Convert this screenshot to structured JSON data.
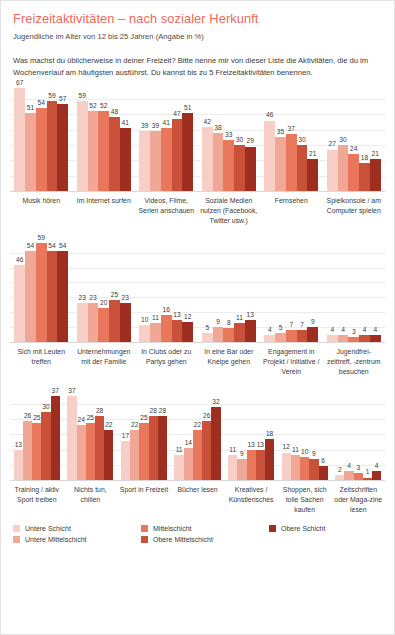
{
  "header": {
    "title": "Freizeitaktivitäten – nach sozialer Herkunft",
    "subtitle": "Jugendliche im Alter von 12 bis 25 Jahren (Angabe in %)",
    "question": "Was machst du üblicherweise in deiner Freizeit? Bitte nenne mir von dieser Liste die Aktivitäten, die du im Wochenverlauf am häufigsten ausführst. Du kannst bis zu 5 Freizeitaktivitäten benennen."
  },
  "legend": {
    "items": [
      {
        "label": "Untere Schicht",
        "color": "#f8cfc6"
      },
      {
        "label": "Untere Mittelschicht",
        "color": "#f1a795"
      },
      {
        "label": "Mittelschicht",
        "color": "#e8775c"
      },
      {
        "label": "Obere Mittelschicht",
        "color": "#c9513a"
      },
      {
        "label": "Obere Schicht",
        "color": "#9e2f20"
      }
    ],
    "columns": [
      [
        0,
        1
      ],
      [
        2,
        3
      ],
      [
        4
      ]
    ]
  },
  "chart_data": {
    "type": "bar",
    "title": "Freizeitaktivitäten – nach sozialer Herkunft",
    "subtitle": "Jugendliche im Alter von 12 bis 25 Jahren (Angabe in %)",
    "xlabel": "",
    "ylabel": "Prozent",
    "ylim": [
      0,
      70
    ],
    "grid": true,
    "legend_position": "bottom",
    "series": [
      {
        "name": "Untere Schicht",
        "color": "#f8cfc6"
      },
      {
        "name": "Untere Mittelschicht",
        "color": "#f1a795"
      },
      {
        "name": "Mittelschicht",
        "color": "#e8775c"
      },
      {
        "name": "Obere Mittelschicht",
        "color": "#c9513a"
      },
      {
        "name": "Obere Schicht",
        "color": "#9e2f20"
      }
    ],
    "rows": [
      {
        "row_max": 70,
        "gridlines": 6,
        "categories": [
          {
            "label": "Musik hören",
            "values": [
              67,
              51,
              54,
              59,
              57
            ]
          },
          {
            "label": "Im Internet surfen",
            "values": [
              59,
              52,
              52,
              48,
              41
            ]
          },
          {
            "label": "Videos, Filme, Serien anschauen",
            "values": [
              39,
              39,
              41,
              47,
              51
            ]
          },
          {
            "label": "Soziale Medien nutzen (Facebook, Twitter usw.)",
            "values": [
              42,
              38,
              33,
              30,
              29
            ]
          },
          {
            "label": "Fernsehen",
            "values": [
              46,
              35,
              37,
              30,
              21
            ]
          },
          {
            "label": "Spielkonsole / am Computer spielen",
            "values": [
              27,
              30,
              24,
              18,
              21
            ]
          }
        ]
      },
      {
        "row_max": 62,
        "gridlines": 6,
        "categories": [
          {
            "label": "Sich mit Leuten treffen",
            "values": [
              46,
              54,
              59,
              54,
              54
            ]
          },
          {
            "label": "Unternehmungen mit der Familie",
            "values": [
              23,
              23,
              20,
              25,
              23
            ]
          },
          {
            "label": "In Clubs oder zu Partys gehen",
            "values": [
              10,
              11,
              16,
              13,
              12
            ]
          },
          {
            "label": "In eine Bar oder Kneipe gehen",
            "values": [
              5,
              9,
              8,
              11,
              13
            ]
          },
          {
            "label": "Engagement in Projekt / Initiative / Verein",
            "values": [
              4,
              5,
              7,
              7,
              9
            ]
          },
          {
            "label": "Jugendfrei-zeittreff, -zentrum besuchen",
            "values": [
              4,
              4,
              3,
              4,
              4
            ]
          }
        ]
      },
      {
        "row_max": 40,
        "gridlines": 5,
        "categories": [
          {
            "label": "Training / aktiv Sport treiben",
            "values": [
              13,
              26,
              25,
              30,
              37
            ]
          },
          {
            "label": "Nichts tun, chillen",
            "values": [
              37,
              24,
              25,
              28,
              22
            ]
          },
          {
            "label": "Sport in Freizeit",
            "values": [
              17,
              22,
              25,
              28,
              28
            ]
          },
          {
            "label": "Bücher lesen",
            "values": [
              11,
              14,
              22,
              26,
              32
            ]
          },
          {
            "label": "Kreatives / Künstlerisches",
            "values": [
              11,
              9,
              13,
              13,
              18
            ]
          },
          {
            "label": "Shoppen, sich tolle Sachen kaufen",
            "values": [
              12,
              11,
              10,
              9,
              6
            ]
          },
          {
            "label": "Zeitschriften oder Maga-zine lesen",
            "values": [
              2,
              4,
              3,
              1,
              4
            ]
          }
        ]
      }
    ]
  }
}
